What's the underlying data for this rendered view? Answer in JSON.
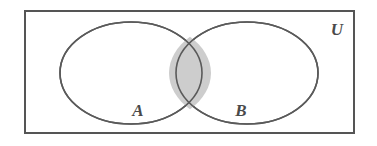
{
  "figure": {
    "width": 377,
    "height": 146,
    "background_color": "#ffffff"
  },
  "universal_set": {
    "label": "U",
    "label_x": 337,
    "label_y": 31,
    "rect": {
      "x": 25,
      "y": 11,
      "width": 329,
      "height": 122
    },
    "stroke_color": "#555555",
    "stroke_width": 2,
    "fill_color": "#ffffff"
  },
  "sets": [
    {
      "name": "set-a",
      "label": "A",
      "label_x": 138,
      "label_y": 112,
      "cx": 131,
      "cy": 73,
      "rx": 71,
      "ry": 51,
      "stroke_color": "#5a5a5a",
      "stroke_width": 1.6,
      "fill_color": "#ffffff"
    },
    {
      "name": "set-b",
      "label": "B",
      "label_x": 241,
      "label_y": 112,
      "cx": 247,
      "cy": 73,
      "rx": 71,
      "ry": 51,
      "stroke_color": "#5a5a5a",
      "stroke_width": 1.6,
      "fill_color": "#ffffff"
    }
  ],
  "intersection": {
    "name": "a-intersect-b",
    "shaded": true,
    "fill_color": "#cdcdcd",
    "stroke_color": "#5a5a5a",
    "stroke_width": 1.6,
    "top_crossing": {
      "x": 190,
      "y": 37
    },
    "bottom_crossing": {
      "x": 190,
      "y": 110
    },
    "left_extent": 172,
    "right_extent": 208,
    "path": "M 190 36.8 A 71 51 0 0 1 190 109.2 A 71 51 0 0 1 190 36.8 Z"
  }
}
